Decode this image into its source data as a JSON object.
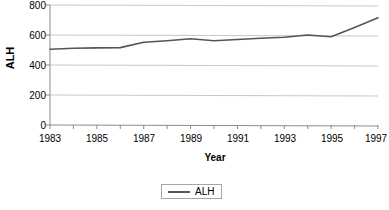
{
  "chart_data": {
    "type": "line",
    "title": "",
    "subtitle": "",
    "xlabel": "Year",
    "ylabel": "ALH",
    "xlim": [
      1983,
      1997
    ],
    "ylim": [
      0,
      800
    ],
    "ytick_values": [
      0,
      200,
      400,
      600,
      800
    ],
    "ytick_labels": [
      "0",
      "200",
      "400",
      "600",
      "800"
    ],
    "xtick_values": [
      1983,
      1985,
      1987,
      1989,
      1991,
      1993,
      1995,
      1997
    ],
    "xtick_labels": [
      "1983",
      "1985",
      "1987",
      "1989",
      "1991",
      "1993",
      "1995",
      "1997"
    ],
    "grid": "horizontal",
    "legend_position": "bottom-center",
    "x": [
      1983,
      1984,
      1985,
      1986,
      1987,
      1988,
      1989,
      1990,
      1991,
      1992,
      1993,
      1994,
      1995,
      1996,
      1997
    ],
    "series": [
      {
        "name": "ALH",
        "color": "#555555",
        "values": [
          505,
          512,
          514,
          516,
          552,
          562,
          575,
          562,
          570,
          578,
          585,
          600,
          588,
          650,
          715
        ]
      }
    ],
    "annotations": []
  },
  "legend": {
    "entries": [
      {
        "label": "ALH",
        "swatch": "line-swatch"
      }
    ]
  },
  "axis_titles": {
    "x": "Year",
    "y": "ALH"
  },
  "colors": {
    "series_line": "#555555",
    "gridline": "#c8c8c8",
    "axis": "#8c8c8c",
    "text": "#000000",
    "background": "#ffffff"
  }
}
